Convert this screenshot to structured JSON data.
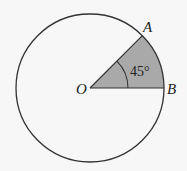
{
  "diagram": {
    "type": "circle-sector",
    "circle": {
      "cx": 90,
      "cy": 88,
      "r": 74,
      "stroke": "#333333"
    },
    "sector": {
      "start_deg": 0,
      "end_deg": 45,
      "fill": "#a9a9a9"
    },
    "angle_arc": {
      "r": 38
    },
    "labels": {
      "center": "O",
      "point_a": "A",
      "point_b": "B",
      "angle": "45°"
    },
    "colors": {
      "background": "#f7f7f7",
      "stroke": "#333333",
      "sector_fill": "#a9a9a9"
    }
  }
}
